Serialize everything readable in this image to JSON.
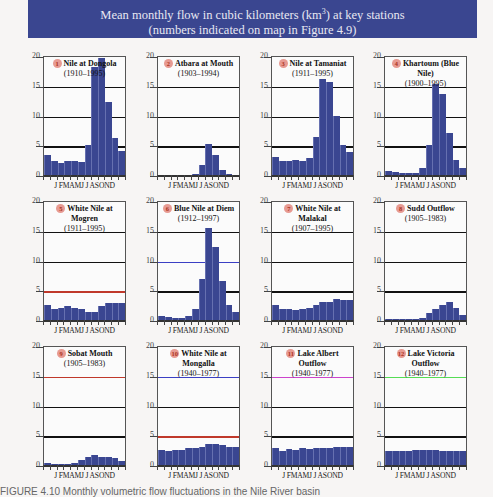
{
  "header": {
    "title_line1_pre": "Mean monthly flow in cubic kilometers (km",
    "title_sup": "3",
    "title_line1_post": ") at key stations",
    "title_line2": "(numbers indicated on map in Figure 4.9)",
    "background_color": "#3a4690"
  },
  "caption": "FIGURE 4.10  Monthly volumetric flow fluctuations in the Nile River basin",
  "axis": {
    "y_ticks": [
      "20",
      "15",
      "10",
      "5",
      "0"
    ],
    "months": "J FMAMJ J ASOND"
  },
  "chart_data": [
    {
      "type": "bar",
      "id": 1,
      "title": "Nile at Dongola",
      "period": "(1910–1995)",
      "categories": [
        "J",
        "F",
        "M",
        "A",
        "M",
        "J",
        "J",
        "A",
        "S",
        "O",
        "N",
        "D"
      ],
      "values": [
        3.3,
        2.3,
        2.1,
        2.4,
        2.4,
        2.2,
        5.1,
        18.2,
        19.6,
        12.2,
        6.2,
        4.1
      ],
      "ylim": [
        0,
        20
      ],
      "ylabel": "km³",
      "highlight_lines": {}
    },
    {
      "type": "bar",
      "id": 2,
      "title": "Atbara at Mouth",
      "period": "(1903–1994)",
      "categories": [
        "J",
        "F",
        "M",
        "A",
        "M",
        "J",
        "J",
        "A",
        "S",
        "O",
        "N",
        "D"
      ],
      "values": [
        0,
        0,
        0,
        0,
        0,
        0.1,
        1.6,
        5.2,
        3.3,
        0.8,
        0.1,
        0
      ],
      "ylim": [
        0,
        20
      ],
      "highlight_lines": {}
    },
    {
      "type": "bar",
      "id": 3,
      "title": "Nile at Tamaniat",
      "period": "(1911–1995)",
      "categories": [
        "J",
        "F",
        "M",
        "A",
        "M",
        "J",
        "J",
        "A",
        "S",
        "O",
        "N",
        "D"
      ],
      "values": [
        3.1,
        2.3,
        2.4,
        2.6,
        2.4,
        2.9,
        6.4,
        16.2,
        15.6,
        10,
        5.1,
        3.8
      ],
      "ylim": [
        0,
        20
      ],
      "highlight_lines": {}
    },
    {
      "type": "bar",
      "id": 4,
      "title": "Khartoum (Blue Nile)",
      "period": "(1900–1995)",
      "categories": [
        "J",
        "F",
        "M",
        "A",
        "M",
        "J",
        "J",
        "A",
        "S",
        "O",
        "N",
        "D"
      ],
      "values": [
        0.6,
        0.5,
        0.3,
        0.3,
        0.4,
        1.1,
        5,
        15.3,
        13.6,
        7.1,
        2.5,
        1.1
      ],
      "ylim": [
        0,
        20
      ],
      "highlight_lines": {}
    },
    {
      "type": "bar",
      "id": 5,
      "title": "White Nile at Mogren",
      "period": "(1911–1995)",
      "categories": [
        "J",
        "F",
        "M",
        "A",
        "M",
        "J",
        "J",
        "A",
        "S",
        "O",
        "N",
        "D"
      ],
      "values": [
        2.5,
        1.9,
        2.1,
        2.3,
        2,
        1.9,
        1.3,
        1.4,
        2.3,
        2.9,
        2.8,
        2.8
      ],
      "ylim": [
        0,
        20
      ],
      "highlight_lines": {
        "5": "#c0392b"
      }
    },
    {
      "type": "bar",
      "id": 6,
      "title": "Blue Nile at Diem",
      "period": "(1912–1997)",
      "categories": [
        "J",
        "F",
        "M",
        "A",
        "M",
        "J",
        "J",
        "A",
        "S",
        "O",
        "N",
        "D"
      ],
      "values": [
        0.7,
        0.5,
        0.4,
        0.4,
        0.7,
        1.8,
        6.9,
        15.4,
        12.2,
        6.5,
        2.6,
        1.3
      ],
      "ylim": [
        0,
        20
      ],
      "highlight_lines": {
        "10": "#3b3fc4"
      }
    },
    {
      "type": "bar",
      "id": 7,
      "title": "White Nile at Malakal",
      "period": "(1907–1995)",
      "categories": [
        "J",
        "F",
        "M",
        "A",
        "M",
        "J",
        "J",
        "A",
        "S",
        "O",
        "N",
        "D"
      ],
      "values": [
        2.5,
        1.9,
        1.8,
        1.6,
        1.8,
        2.1,
        2.5,
        3,
        3.1,
        3.5,
        3.4,
        3.3
      ],
      "ylim": [
        0,
        20
      ],
      "highlight_lines": {}
    },
    {
      "type": "bar",
      "id": 8,
      "title": "Sudd Outflow",
      "period": "(1905–1983)",
      "categories": [
        "J",
        "F",
        "M",
        "A",
        "M",
        "J",
        "J",
        "A",
        "S",
        "O",
        "N",
        "D"
      ],
      "values": [
        0.2,
        0.1,
        0.1,
        0.1,
        0.1,
        0.4,
        1.1,
        1.9,
        2.6,
        3,
        2,
        0.8,
        0.4
      ],
      "ylim": [
        0,
        20
      ],
      "highlight_lines": {}
    },
    {
      "type": "bar",
      "id": 9,
      "title": "Sobat Mouth",
      "period": "(1905–1983)",
      "categories": [
        "J",
        "F",
        "M",
        "A",
        "M",
        "J",
        "J",
        "A",
        "S",
        "O",
        "N",
        "D"
      ],
      "values": [
        0.3,
        0.1,
        0.1,
        0.1,
        0.4,
        0.9,
        1.3,
        1.6,
        1.4,
        1.4,
        1.1,
        0.7
      ],
      "ylim": [
        0,
        20
      ],
      "highlight_lines": {
        "15": "#c0392b"
      }
    },
    {
      "type": "bar",
      "id": 10,
      "title": "White Nile at Mongalla",
      "period": "(1940–1977)",
      "categories": [
        "J",
        "F",
        "M",
        "A",
        "M",
        "J",
        "J",
        "A",
        "S",
        "O",
        "N",
        "D"
      ],
      "values": [
        2.6,
        2.3,
        2.5,
        2.5,
        2.8,
        2.8,
        3.1,
        3.6,
        3.5,
        3.4,
        3.1,
        3
      ],
      "ylim": [
        0,
        20
      ],
      "highlight_lines": {
        "15": "#3b3fc4",
        "5": "#c0392b"
      }
    },
    {
      "type": "bar",
      "id": 11,
      "title": "Lake Albert Outflow",
      "period": "(1940–1977)",
      "categories": [
        "J",
        "F",
        "M",
        "A",
        "M",
        "J",
        "J",
        "A",
        "S",
        "O",
        "N",
        "D"
      ],
      "values": [
        2.9,
        2.4,
        2.7,
        2.6,
        2.8,
        2.7,
        2.8,
        2.9,
        2.9,
        3,
        3,
        3
      ],
      "ylim": [
        0,
        20
      ],
      "highlight_lines": {
        "15": "#cc44cc"
      }
    },
    {
      "type": "bar",
      "id": 12,
      "title": "Lake Victoria Outflow",
      "period": "(1940–1977)",
      "categories": [
        "J",
        "F",
        "M",
        "A",
        "M",
        "J",
        "J",
        "A",
        "S",
        "O",
        "N",
        "D"
      ],
      "values": [
        2.3,
        2.4,
        2.3,
        2.3,
        2.6,
        2.6,
        2.5,
        2.5,
        2.4,
        2.4,
        2.3,
        2.4
      ],
      "ylim": [
        0,
        20
      ],
      "highlight_lines": {
        "15": "#55dd55"
      }
    }
  ]
}
